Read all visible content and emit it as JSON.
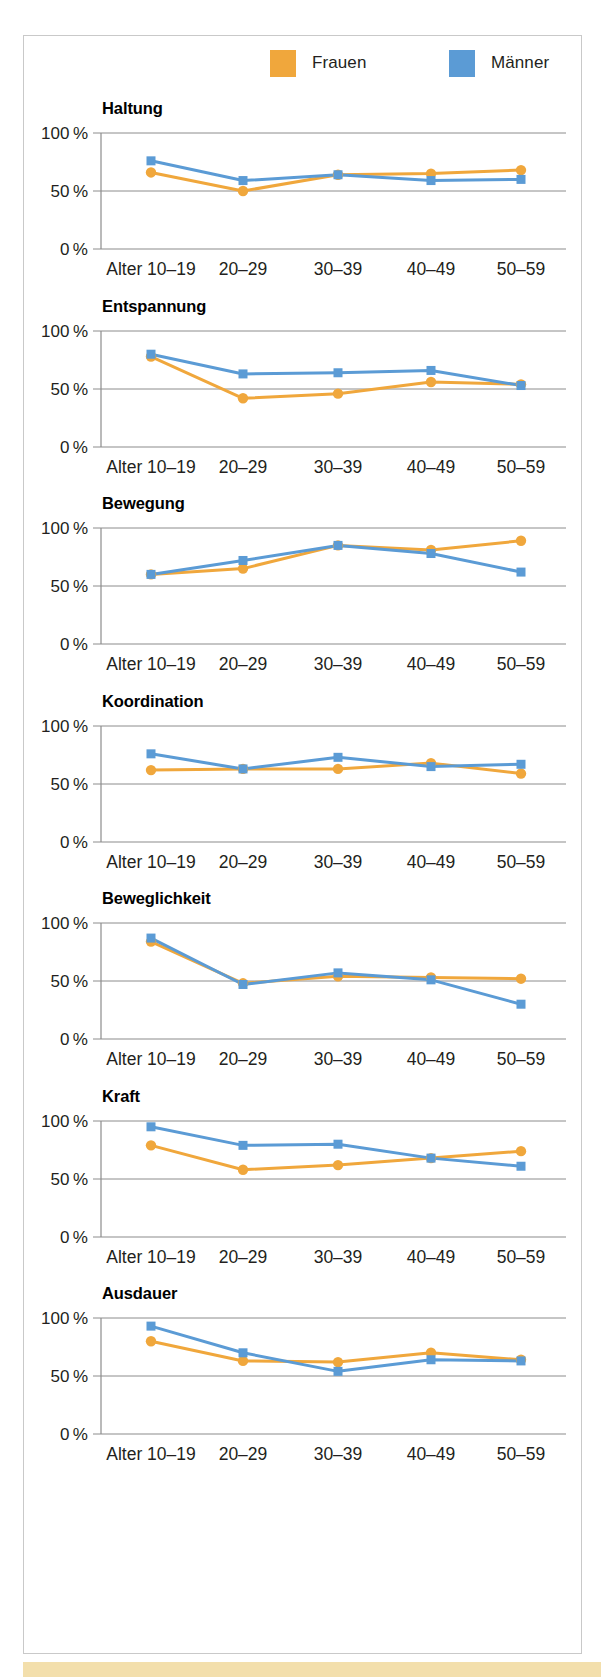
{
  "legend": {
    "entries": [
      {
        "label": "Frauen",
        "color": "#F0A73C",
        "marker": "circle"
      },
      {
        "label": "Männer",
        "color": "#5B9BD5",
        "marker": "square"
      }
    ]
  },
  "axis": {
    "y_ticks": [
      "100 %",
      "50 %",
      "0 %"
    ],
    "y_tick_values": [
      100,
      50,
      0
    ],
    "x_labels": [
      "Alter 10–19",
      "20–29",
      "30–39",
      "40–49",
      "50–59"
    ]
  },
  "caption": {
    "text": ""
  },
  "chart_data": [
    {
      "type": "line",
      "title": "Haltung",
      "xlabel": "",
      "ylabel": "",
      "ylim": [
        0,
        100
      ],
      "grid": true,
      "legend_position": "top",
      "categories": [
        "Alter 10–19",
        "20–29",
        "30–39",
        "40–49",
        "50–59"
      ],
      "series": [
        {
          "name": "Frauen",
          "color": "#F0A73C",
          "marker": "circle",
          "values": [
            66,
            50,
            64,
            65,
            68
          ]
        },
        {
          "name": "Männer",
          "color": "#5B9BD5",
          "marker": "square",
          "values": [
            76,
            59,
            64,
            59,
            60
          ]
        }
      ]
    },
    {
      "type": "line",
      "title": "Entspannung",
      "xlabel": "",
      "ylabel": "",
      "ylim": [
        0,
        100
      ],
      "grid": true,
      "legend_position": "top",
      "categories": [
        "Alter 10–19",
        "20–29",
        "30–39",
        "40–49",
        "50–59"
      ],
      "series": [
        {
          "name": "Frauen",
          "color": "#F0A73C",
          "marker": "circle",
          "values": [
            78,
            42,
            46,
            56,
            54
          ]
        },
        {
          "name": "Männer",
          "color": "#5B9BD5",
          "marker": "square",
          "values": [
            80,
            63,
            64,
            66,
            53
          ]
        }
      ]
    },
    {
      "type": "line",
      "title": "Bewegung",
      "xlabel": "",
      "ylabel": "",
      "ylim": [
        0,
        100
      ],
      "grid": true,
      "legend_position": "top",
      "categories": [
        "Alter 10–19",
        "20–29",
        "30–39",
        "40–49",
        "50–59"
      ],
      "series": [
        {
          "name": "Frauen",
          "color": "#F0A73C",
          "marker": "circle",
          "values": [
            60,
            65,
            85,
            81,
            89
          ]
        },
        {
          "name": "Männer",
          "color": "#5B9BD5",
          "marker": "square",
          "values": [
            60,
            72,
            85,
            78,
            62
          ]
        }
      ]
    },
    {
      "type": "line",
      "title": "Koordination",
      "xlabel": "",
      "ylabel": "",
      "ylim": [
        0,
        100
      ],
      "grid": true,
      "legend_position": "top",
      "categories": [
        "Alter 10–19",
        "20–29",
        "30–39",
        "40–49",
        "50–59"
      ],
      "series": [
        {
          "name": "Frauen",
          "color": "#F0A73C",
          "marker": "circle",
          "values": [
            62,
            63,
            63,
            68,
            59
          ]
        },
        {
          "name": "Männer",
          "color": "#5B9BD5",
          "marker": "square",
          "values": [
            76,
            63,
            73,
            65,
            67
          ]
        }
      ]
    },
    {
      "type": "line",
      "title": "Beweglichkeit",
      "xlabel": "",
      "ylabel": "",
      "ylim": [
        0,
        100
      ],
      "grid": true,
      "legend_position": "top",
      "categories": [
        "Alter 10–19",
        "20–29",
        "30–39",
        "40–49",
        "50–59"
      ],
      "series": [
        {
          "name": "Frauen",
          "color": "#F0A73C",
          "marker": "circle",
          "values": [
            84,
            48,
            54,
            53,
            52
          ]
        },
        {
          "name": "Männer",
          "color": "#5B9BD5",
          "marker": "square",
          "values": [
            87,
            47,
            57,
            51,
            30
          ]
        }
      ]
    },
    {
      "type": "line",
      "title": "Kraft",
      "xlabel": "",
      "ylabel": "",
      "ylim": [
        0,
        100
      ],
      "grid": true,
      "legend_position": "top",
      "categories": [
        "Alter 10–19",
        "20–29",
        "30–39",
        "40–49",
        "50–59"
      ],
      "series": [
        {
          "name": "Frauen",
          "color": "#F0A73C",
          "marker": "circle",
          "values": [
            79,
            58,
            62,
            68,
            74
          ]
        },
        {
          "name": "Männer",
          "color": "#5B9BD5",
          "marker": "square",
          "values": [
            95,
            79,
            80,
            68,
            61
          ]
        }
      ]
    },
    {
      "type": "line",
      "title": "Ausdauer",
      "xlabel": "",
      "ylabel": "",
      "ylim": [
        0,
        100
      ],
      "grid": true,
      "legend_position": "top",
      "categories": [
        "Alter 10–19",
        "20–29",
        "30–39",
        "40–49",
        "50–59"
      ],
      "series": [
        {
          "name": "Frauen",
          "color": "#F0A73C",
          "marker": "circle",
          "values": [
            80,
            63,
            62,
            70,
            64
          ]
        },
        {
          "name": "Männer",
          "color": "#5B9BD5",
          "marker": "square",
          "values": [
            93,
            70,
            54,
            64,
            63
          ]
        }
      ]
    }
  ]
}
